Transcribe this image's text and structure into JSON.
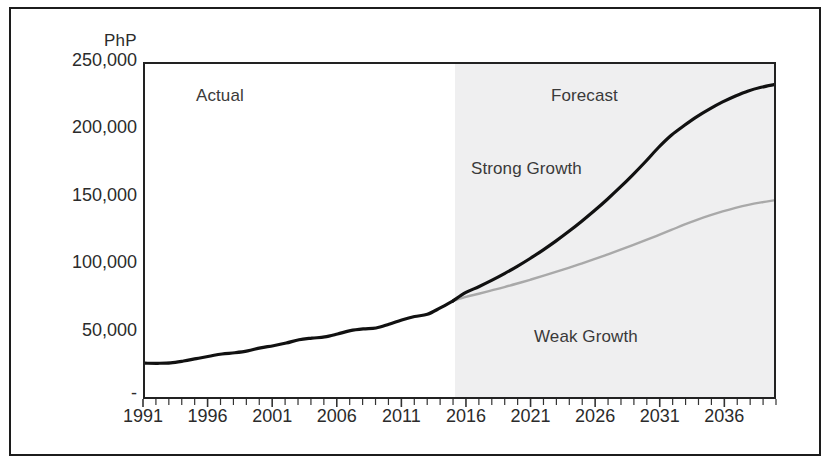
{
  "chart_data": {
    "type": "line",
    "title": "",
    "subtitle": "",
    "xlabel": "",
    "ylabel": "PhP",
    "y_unit_label": "PhP",
    "xlim": [
      1991,
      2040
    ],
    "ylim": [
      0,
      250000
    ],
    "grid": false,
    "legend_position": "none",
    "y_ticks": [
      {
        "value": 250000,
        "label": "250,000"
      },
      {
        "value": 200000,
        "label": "200,000"
      },
      {
        "value": 150000,
        "label": "150,000"
      },
      {
        "value": 100000,
        "label": "100,000"
      },
      {
        "value": 50000,
        "label": "50,000"
      },
      {
        "value": 0,
        "label": "-"
      }
    ],
    "x_ticks": [
      {
        "value": 1991,
        "label": "1991"
      },
      {
        "value": 1996,
        "label": "1996"
      },
      {
        "value": 2001,
        "label": "2001"
      },
      {
        "value": 2006,
        "label": "2006"
      },
      {
        "value": 2011,
        "label": "2011"
      },
      {
        "value": 2016,
        "label": "2016"
      },
      {
        "value": 2021,
        "label": "2021"
      },
      {
        "value": 2026,
        "label": "2026"
      },
      {
        "value": 2031,
        "label": "2031"
      },
      {
        "value": 2036,
        "label": "2036"
      }
    ],
    "x_minor_tick_step": 1,
    "annotations": [
      {
        "id": "actual",
        "text": "Actual",
        "x": 1997,
        "y": 218000
      },
      {
        "id": "forecast",
        "text": "Forecast",
        "x": 2025,
        "y": 218000
      },
      {
        "id": "strong",
        "text": "Strong Growth",
        "x": 2019,
        "y": 164000
      },
      {
        "id": "weak",
        "text": "Weak Growth",
        "x": 2030,
        "y": 38000
      }
    ],
    "shaded_regions": [
      {
        "id": "forecast-band",
        "x_start": 2015,
        "x_end": 2040,
        "color": "#efeff0",
        "label": "Forecast"
      }
    ],
    "series": [
      {
        "name": "Actual",
        "color": "#111111",
        "width": 3.2,
        "x": [
          1991,
          1992,
          1993,
          1994,
          1995,
          1996,
          1997,
          1998,
          1999,
          2000,
          2001,
          2002,
          2003,
          2004,
          2005,
          2006,
          2007,
          2008,
          2009,
          2010,
          2011,
          2012,
          2013,
          2014,
          2015
        ],
        "values": [
          25400,
          25300,
          25600,
          27000,
          28800,
          30600,
          32300,
          33200,
          34600,
          36900,
          38500,
          40500,
          43000,
          44200,
          45100,
          47300,
          49800,
          51100,
          51800,
          54600,
          57800,
          60400,
          62100,
          66900,
          72200
        ]
      },
      {
        "name": "Strong Growth",
        "color": "#111111",
        "width": 3.2,
        "x": [
          2015,
          2016,
          2017,
          2018,
          2019,
          2020,
          2021,
          2022,
          2023,
          2024,
          2025,
          2026,
          2027,
          2028,
          2029,
          2030,
          2031,
          2032,
          2033,
          2034,
          2035,
          2036,
          2037,
          2038,
          2039,
          2040
        ],
        "values": [
          72200,
          78500,
          82800,
          87500,
          92600,
          98100,
          104000,
          110300,
          117000,
          124200,
          131800,
          139800,
          148300,
          157300,
          166800,
          176800,
          187300,
          196500,
          203800,
          210500,
          216300,
          221500,
          226000,
          229800,
          232500,
          234500
        ]
      },
      {
        "name": "Weak Growth",
        "color": "#a9a9a9",
        "width": 2.4,
        "x": [
          2015,
          2016,
          2017,
          2018,
          2019,
          2020,
          2021,
          2022,
          2023,
          2024,
          2025,
          2026,
          2027,
          2028,
          2029,
          2030,
          2031,
          2032,
          2033,
          2034,
          2035,
          2036,
          2037,
          2038,
          2039,
          2040
        ],
        "values": [
          72200,
          75200,
          77500,
          80000,
          82500,
          85200,
          88000,
          90900,
          93900,
          97000,
          100200,
          103500,
          106900,
          110400,
          114000,
          117700,
          121500,
          125400,
          129400,
          133000,
          136300,
          139300,
          142000,
          144300,
          146100,
          147600
        ]
      }
    ]
  },
  "y_unit": "PhP"
}
